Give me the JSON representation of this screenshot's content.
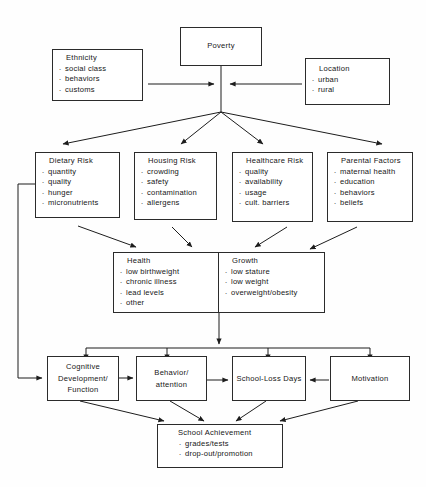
{
  "diagram": {
    "stroke_color": "#2b2b2b",
    "background_color": "#fefefe",
    "text_color": "#161616"
  },
  "nodes": {
    "poverty": {
      "title": "Poverty"
    },
    "ethnicity": {
      "title": "Ethnicity",
      "items": [
        "social class",
        "behaviors",
        "customs"
      ]
    },
    "location": {
      "title": "Location",
      "items": [
        "urban",
        "rural"
      ]
    },
    "dietary_risk": {
      "title": "Dietary Risk",
      "items": [
        "quantity",
        "quality",
        "hunger",
        "micronutrients"
      ]
    },
    "housing_risk": {
      "title": "Housing Risk",
      "items": [
        "crowding",
        "safety",
        "contamination",
        "allergens"
      ]
    },
    "healthcare_risk": {
      "title": "Healthcare Risk",
      "items": [
        "quality",
        "availability",
        "usage",
        "cult. barriers"
      ]
    },
    "parental_factors": {
      "title": "Parental Factors",
      "items": [
        "maternal health",
        "education",
        "behaviors",
        "beliefs"
      ]
    },
    "health": {
      "title": "Health",
      "items": [
        "low birthweight",
        "chronic illness",
        "lead levels",
        "other"
      ]
    },
    "growth": {
      "title": "Growth",
      "items": [
        "low stature",
        "low weight",
        "overweight/obesity"
      ]
    },
    "cognitive_development": {
      "title": "Cognitive Development/ Function"
    },
    "behavior_attention": {
      "title": "Behavior/ attention"
    },
    "school_loss_days": {
      "title": "School-Loss Days"
    },
    "motivation": {
      "title": "Motivation"
    },
    "school_achievement": {
      "title": "School Achievement",
      "items": [
        "grades/tests",
        "drop-out/promotion"
      ]
    }
  },
  "edges": [
    {
      "name": "ethnicity-to-poverty-stem",
      "from": "ethnicity",
      "to": "poverty-stem",
      "arrow": true
    },
    {
      "name": "location-to-poverty-stem",
      "from": "location",
      "to": "poverty-stem",
      "arrow": true
    },
    {
      "name": "poverty-to-hub",
      "from": "poverty",
      "to": "fanout-hub",
      "arrow": false
    },
    {
      "name": "hub-to-dietary-risk",
      "from": "fanout-hub",
      "to": "dietary_risk",
      "arrow": true
    },
    {
      "name": "hub-to-housing-risk",
      "from": "fanout-hub",
      "to": "housing_risk",
      "arrow": true
    },
    {
      "name": "hub-to-healthcare-risk",
      "from": "fanout-hub",
      "to": "healthcare_risk",
      "arrow": true
    },
    {
      "name": "hub-to-parental-factors",
      "from": "fanout-hub",
      "to": "parental_factors",
      "arrow": true
    },
    {
      "name": "dietary-risk-to-health",
      "from": "dietary_risk",
      "to": "health",
      "arrow": true
    },
    {
      "name": "housing-risk-to-health",
      "from": "housing_risk",
      "to": "health",
      "arrow": true
    },
    {
      "name": "healthcare-risk-to-growth",
      "from": "healthcare_risk",
      "to": "growth",
      "arrow": true
    },
    {
      "name": "parental-factors-to-growth",
      "from": "parental_factors",
      "to": "growth",
      "arrow": true
    },
    {
      "name": "health-growth-bidirectional",
      "from": "health",
      "to": "growth",
      "arrow": "both"
    },
    {
      "name": "healthgrowth-to-bus",
      "from": "health_growth",
      "to": "distribution-bus",
      "arrow": true
    },
    {
      "name": "bus-to-cognitive-development",
      "from": "distribution-bus",
      "to": "cognitive_development",
      "arrow": true
    },
    {
      "name": "bus-to-behavior-attention",
      "from": "distribution-bus",
      "to": "behavior_attention",
      "arrow": true
    },
    {
      "name": "bus-to-school-loss-days",
      "from": "distribution-bus",
      "to": "school_loss_days",
      "arrow": true
    },
    {
      "name": "bus-to-motivation",
      "from": "distribution-bus",
      "to": "motivation",
      "arrow": true
    },
    {
      "name": "dietary-risk-feedback-to-cognitive",
      "from": "dietary_risk",
      "to": "cognitive_development",
      "arrow": true
    },
    {
      "name": "cognitive-to-behavior",
      "from": "cognitive_development",
      "to": "behavior_attention",
      "arrow": true
    },
    {
      "name": "behavior-to-school-loss",
      "from": "behavior_attention",
      "to": "school_loss_days",
      "arrow": true
    },
    {
      "name": "motivation-to-school-loss",
      "from": "motivation",
      "to": "school_loss_days",
      "arrow": true
    },
    {
      "name": "cognitive-to-achievement",
      "from": "cognitive_development",
      "to": "school_achievement",
      "arrow": true
    },
    {
      "name": "behavior-to-achievement",
      "from": "behavior_attention",
      "to": "school_achievement",
      "arrow": true
    },
    {
      "name": "school-loss-to-achievement",
      "from": "school_loss_days",
      "to": "school_achievement",
      "arrow": true
    },
    {
      "name": "motivation-to-achievement",
      "from": "motivation",
      "to": "school_achievement",
      "arrow": true
    }
  ]
}
